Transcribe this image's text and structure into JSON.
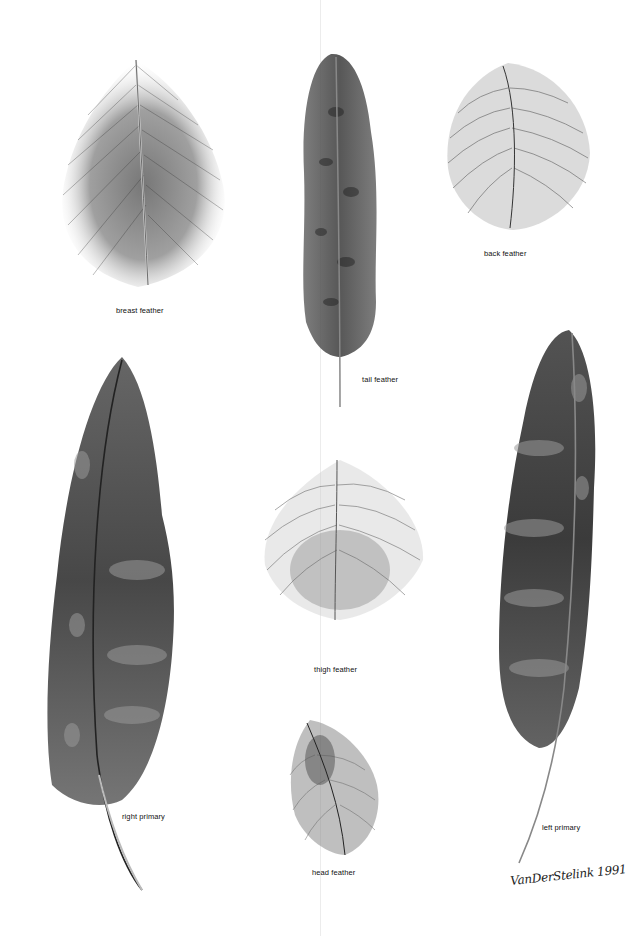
{
  "plate": {
    "background": "#ffffff",
    "ink": "#1a1a1a",
    "signature": "VanDerStelink 1991"
  },
  "feathers": [
    {
      "id": "breast",
      "label": "breast feather"
    },
    {
      "id": "tail",
      "label": "tail feather"
    },
    {
      "id": "back",
      "label": "back feather"
    },
    {
      "id": "right_primary",
      "label": "right primary"
    },
    {
      "id": "thigh",
      "label": "thigh feather"
    },
    {
      "id": "left_primary",
      "label": "left primary"
    },
    {
      "id": "head",
      "label": "head feather"
    }
  ]
}
